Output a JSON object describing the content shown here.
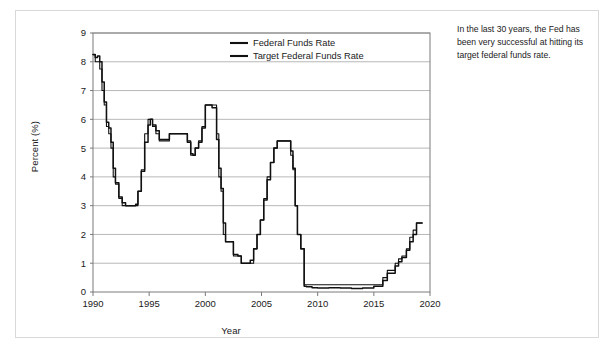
{
  "card": {
    "note_text": "In the last 30 years, the Fed has been very successful at hitting its target federal funds rate."
  },
  "chart_data": {
    "type": "line",
    "title": "",
    "xlabel": "Year",
    "ylabel": "Percent (%)",
    "xlim": [
      1990,
      2020
    ],
    "ylim": [
      0,
      9
    ],
    "xticks": [
      1990,
      1995,
      2000,
      2005,
      2010,
      2015,
      2020
    ],
    "xtick_labels": [
      "1990",
      "1995",
      "2000",
      "2005",
      "2010",
      "2015",
      "2020"
    ],
    "yticks": [
      0,
      1,
      2,
      3,
      4,
      5,
      6,
      7,
      8,
      9
    ],
    "ytick_labels": [
      "0",
      "1",
      "2",
      "3",
      "4",
      "5",
      "6",
      "7",
      "8",
      "9"
    ],
    "grid": "horizontal",
    "grid_color": "#a6a6a6",
    "frame_color": "#7a7a7a",
    "legend_position": "inside-top-right",
    "legend": [
      "Federal Funds Rate",
      "Target Federal Funds Rate"
    ],
    "series": [
      {
        "name": "Federal Funds Rate",
        "color": "#111111",
        "x": [
          1990.0,
          1990.2,
          1990.4,
          1990.6,
          1990.8,
          1991.0,
          1991.2,
          1991.4,
          1991.6,
          1991.8,
          1992.0,
          1992.3,
          1992.6,
          1992.9,
          1993.2,
          1993.5,
          1993.8,
          1994.0,
          1994.3,
          1994.6,
          1994.9,
          1995.1,
          1995.3,
          1995.6,
          1995.9,
          1996.1,
          1996.4,
          1996.8,
          1997.2,
          1997.6,
          1998.0,
          1998.4,
          1998.7,
          1998.9,
          1999.1,
          1999.4,
          1999.7,
          2000.0,
          2000.3,
          2000.6,
          2001.0,
          2001.2,
          2001.4,
          2001.6,
          2001.8,
          2002.0,
          2002.5,
          2002.9,
          2003.2,
          2003.6,
          2004.0,
          2004.3,
          2004.6,
          2004.9,
          2005.2,
          2005.5,
          2005.8,
          2006.1,
          2006.4,
          2006.8,
          2007.2,
          2007.6,
          2007.8,
          2008.0,
          2008.2,
          2008.5,
          2008.8,
          2009.0,
          2009.5,
          2010.0,
          2011.0,
          2012.0,
          2013.0,
          2014.0,
          2015.0,
          2015.8,
          2016.2,
          2016.9,
          2017.2,
          2017.5,
          2017.9,
          2018.2,
          2018.5,
          2018.8,
          2019.0,
          2019.3
        ],
        "y": [
          8.25,
          8.25,
          8.15,
          8.2,
          8.0,
          7.3,
          6.6,
          5.9,
          5.7,
          5.2,
          4.3,
          3.8,
          3.3,
          3.1,
          3.0,
          3.0,
          3.0,
          3.05,
          3.5,
          4.2,
          5.2,
          5.8,
          6.0,
          5.8,
          5.6,
          5.3,
          5.3,
          5.3,
          5.5,
          5.5,
          5.5,
          5.5,
          5.2,
          4.8,
          4.75,
          5.0,
          5.2,
          5.7,
          6.5,
          6.5,
          6.4,
          5.3,
          4.3,
          3.6,
          2.4,
          1.75,
          1.75,
          1.3,
          1.25,
          1.0,
          1.0,
          1.1,
          1.5,
          2.0,
          2.5,
          3.2,
          3.9,
          4.5,
          5.0,
          5.25,
          5.25,
          5.25,
          4.9,
          4.3,
          3.0,
          2.0,
          1.5,
          0.2,
          0.18,
          0.15,
          0.14,
          0.15,
          0.14,
          0.12,
          0.14,
          0.2,
          0.4,
          0.65,
          0.9,
          1.05,
          1.2,
          1.45,
          1.75,
          2.0,
          2.4,
          2.4
        ]
      },
      {
        "name": "Target Federal Funds Rate",
        "color": "#111111",
        "x": [
          1990.0,
          1990.2,
          1990.4,
          1990.6,
          1990.8,
          1991.0,
          1991.2,
          1991.4,
          1991.6,
          1991.8,
          1992.0,
          1992.3,
          1992.6,
          1992.9,
          1993.2,
          1993.5,
          1993.8,
          1994.0,
          1994.3,
          1994.6,
          1994.9,
          1995.1,
          1995.3,
          1995.6,
          1995.9,
          1996.1,
          1996.4,
          1996.8,
          1997.2,
          1997.6,
          1998.0,
          1998.4,
          1998.7,
          1998.9,
          1999.1,
          1999.4,
          1999.7,
          2000.0,
          2000.3,
          2000.6,
          2001.0,
          2001.2,
          2001.4,
          2001.6,
          2001.8,
          2002.0,
          2002.5,
          2002.9,
          2003.2,
          2003.6,
          2004.0,
          2004.3,
          2004.6,
          2004.9,
          2005.2,
          2005.5,
          2005.8,
          2006.1,
          2006.4,
          2006.8,
          2007.2,
          2007.6,
          2007.8,
          2008.0,
          2008.2,
          2008.5,
          2008.8,
          2009.0,
          2009.5,
          2010.0,
          2011.0,
          2012.0,
          2013.0,
          2014.0,
          2015.0,
          2015.8,
          2016.2,
          2016.9,
          2017.2,
          2017.5,
          2017.9,
          2018.2,
          2018.5,
          2018.8,
          2019.0,
          2019.3
        ],
        "y": [
          8.25,
          8.25,
          8.0,
          8.0,
          7.75,
          7.0,
          6.5,
          5.75,
          5.5,
          5.0,
          4.0,
          3.75,
          3.25,
          3.0,
          3.0,
          3.0,
          3.0,
          3.0,
          3.5,
          4.25,
          5.5,
          6.0,
          6.0,
          5.75,
          5.5,
          5.25,
          5.25,
          5.25,
          5.5,
          5.5,
          5.5,
          5.5,
          5.25,
          4.75,
          4.75,
          5.0,
          5.25,
          5.75,
          6.5,
          6.5,
          6.5,
          5.5,
          4.0,
          3.5,
          2.0,
          1.75,
          1.75,
          1.25,
          1.25,
          1.0,
          1.0,
          1.0,
          1.5,
          2.0,
          2.5,
          3.25,
          4.0,
          4.5,
          5.0,
          5.25,
          5.25,
          5.25,
          4.75,
          4.25,
          3.0,
          2.0,
          1.5,
          0.25,
          0.25,
          0.25,
          0.25,
          0.25,
          0.25,
          0.25,
          0.25,
          0.25,
          0.5,
          0.75,
          1.0,
          1.15,
          1.25,
          1.5,
          1.9,
          2.15,
          2.4,
          2.4
        ]
      }
    ]
  }
}
